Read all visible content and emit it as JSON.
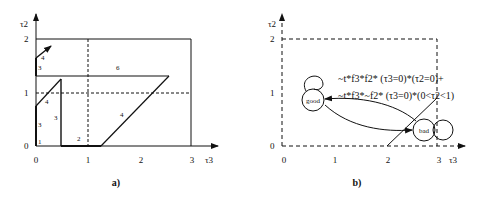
{
  "panel_a": {
    "caption": "a)",
    "x_axis_label": "τ3",
    "y_axis_label": "τ2",
    "x_ticks": [
      "0",
      "1",
      "2",
      "3"
    ],
    "y_ticks": [
      "0",
      "1",
      "2"
    ],
    "region_labels": {
      "r1": "1",
      "r2": "2",
      "r3_bottom": "3",
      "r3_mid": "3",
      "r3_top": "3",
      "r4_small": "4",
      "r4_top": "4",
      "r4_diag": "4",
      "r6": "6"
    }
  },
  "panel_b": {
    "caption": "b)",
    "x_axis_label": "τ3",
    "y_axis_label": "τ2",
    "x_ticks": [
      "0",
      "1",
      "2",
      "3"
    ],
    "y_ticks": [
      "0",
      "1",
      "2"
    ],
    "states": {
      "good": "good",
      "bad": "bad"
    },
    "guard_line_1": "~t*f3*f2*  (τ3=0)*(τ2=0)+",
    "guard_line_2": "~t*f3*~f2* (τ3=0)*(0<τ2<1)"
  }
}
